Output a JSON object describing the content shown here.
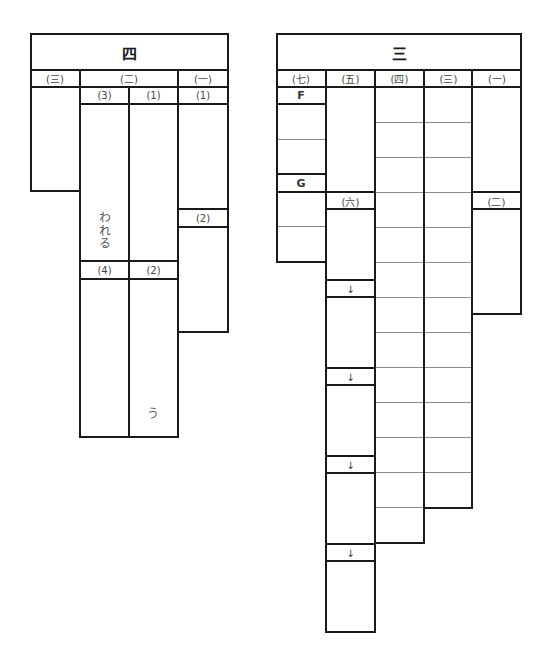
{
  "left_table": {
    "title": "四",
    "sections": [
      {
        "label": "(三)",
        "id": "san"
      },
      {
        "label": "(二)",
        "id": "ni"
      },
      {
        "label": "(一)",
        "id": "ichi"
      }
    ],
    "sub_headers": {
      "ni_3": "(3)",
      "ni_1": "(1)",
      "ichi_1": "(1)",
      "ichi_2": "(2)",
      "ni_4": "(4)",
      "ni_2": "(2)"
    },
    "answers": {
      "ni_3_text": "われる",
      "ni_2_text": "う"
    }
  },
  "right_table": {
    "title": "三",
    "sections": [
      {
        "label": "(七)",
        "id": "shichi"
      },
      {
        "label": "(五)",
        "id": "go"
      },
      {
        "label": "(四)",
        "id": "yon"
      },
      {
        "label": "(三)",
        "id": "san"
      },
      {
        "label": "(一)",
        "id": "ichi"
      }
    ],
    "sub_labels": {
      "shichi_F": "F",
      "shichi_G": "G",
      "go_roku": "(六)",
      "ichi_ni": "(二)"
    },
    "arrows": [
      "↓",
      "↓",
      "↓",
      "↓"
    ],
    "grid_rows": {
      "yon": 13,
      "san": 12
    }
  }
}
